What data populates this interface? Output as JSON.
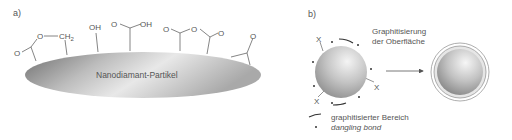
{
  "panel_a": {
    "label": "a)",
    "particle_label": "Nanodiamant-Partikel",
    "groups": {
      "lactone_o_carbonyl": "O",
      "lactone_o_ring": "O",
      "lactone_ch2": "CH",
      "lactone_ch2_sub": "2",
      "hydroxyl": "OH",
      "carboxyl_o": "O",
      "carboxyl_oh": "OH",
      "anhydride_o1": "O",
      "anhydride_o_ring": "O",
      "anhydride_o2": "O",
      "ketone_o": "O"
    }
  },
  "panel_b": {
    "label": "b)",
    "process_line1": "Graphitisierung",
    "process_line2": "der Oberfläche",
    "x_mark": "X",
    "legend": {
      "arc_label": "graphitisierter Bereich",
      "dot_label": "dangling bond"
    }
  }
}
